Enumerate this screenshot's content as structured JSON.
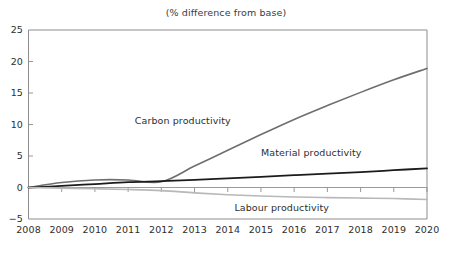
{
  "chart_data": {
    "type": "line",
    "title": "(% difference from base)",
    "xlabel": "",
    "ylabel": "",
    "x": [
      2008,
      2009,
      2010,
      2011,
      2012,
      2013,
      2014,
      2015,
      2016,
      2017,
      2018,
      2019,
      2020
    ],
    "categories": [
      "2008",
      "2009",
      "2010",
      "2011",
      "2012",
      "2013",
      "2014",
      "2015",
      "2016",
      "2017",
      "2018",
      "2019",
      "2020"
    ],
    "xlim": [
      2008,
      2020
    ],
    "ylim": [
      -5,
      25
    ],
    "yticks": [
      -5,
      0,
      5,
      10,
      15,
      20,
      25
    ],
    "ytick_labels": [
      "−5",
      "0",
      "5",
      "10",
      "15",
      "20",
      "25"
    ],
    "grid": false,
    "legend": "inline-labels",
    "series": [
      {
        "name": "Carbon productivity",
        "color": "#6e6e6e",
        "values": [
          0.0,
          0.8,
          1.2,
          1.2,
          0.9,
          3.4,
          5.9,
          8.4,
          10.8,
          13.0,
          15.1,
          17.1,
          18.9
        ],
        "label_x": 2011.2,
        "label_y": 10.6
      },
      {
        "name": "Material productivity",
        "color": "#1b1b1b",
        "values": [
          0.0,
          0.25,
          0.55,
          0.85,
          1.0,
          1.2,
          1.45,
          1.7,
          1.95,
          2.2,
          2.45,
          2.75,
          3.05
        ],
        "label_x": 2015.0,
        "label_y": 5.4
      },
      {
        "name": "Labour productivity",
        "color": "#b8b8b8",
        "values": [
          0.0,
          -0.1,
          -0.2,
          -0.32,
          -0.5,
          -0.85,
          -1.15,
          -1.35,
          -1.5,
          -1.6,
          -1.68,
          -1.75,
          -1.9
        ],
        "label_x": 2014.2,
        "label_y": -3.3
      }
    ]
  },
  "axes": {
    "zero_line_color": "#9a9a9a",
    "spine_color": "#8d8d8d",
    "tick_color": "#8d8d8d"
  }
}
